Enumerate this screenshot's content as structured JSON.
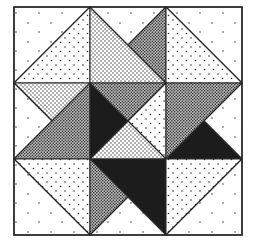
{
  "figure": {
    "grid": {
      "rows": 3,
      "cols": 3,
      "x": [
        14,
        90,
        166,
        242
      ],
      "y": [
        7,
        83,
        159,
        235
      ]
    },
    "colors": {
      "background": "#ffffff",
      "line": "#2a2a2a",
      "ink": "#1c1c1c"
    },
    "fabrics": {
      "sparse": "white with scattered dots",
      "light": "light dotted",
      "medium": "medium dotted",
      "dense": "dense dotted",
      "black": "solid black"
    },
    "blocks": [
      {
        "name": "block-top-left",
        "triangles": [
          {
            "points": "14,7 90,7 14,83",
            "fabric": "sparse"
          },
          {
            "points": "90,7 90,83 14,83",
            "fabric": "light"
          }
        ]
      },
      {
        "name": "block-top-center",
        "triangles": [
          {
            "points": "90,7 90,83 166,83",
            "fabric": "medium"
          },
          {
            "points": "90,7 166,7 128,45",
            "fabric": "sparse"
          },
          {
            "points": "166,7 166,83 128,45",
            "fabric": "dense"
          }
        ]
      },
      {
        "name": "block-top-right",
        "triangles": [
          {
            "points": "166,7 242,7 242,83",
            "fabric": "sparse"
          },
          {
            "points": "166,7 166,83 242,83",
            "fabric": "light"
          }
        ]
      },
      {
        "name": "block-middle-left",
        "triangles": [
          {
            "points": "14,83 90,83 52,121",
            "fabric": "medium"
          },
          {
            "points": "14,83 14,159 52,121",
            "fabric": "sparse"
          },
          {
            "points": "90,83 90,159 14,159",
            "fabric": "dense"
          }
        ]
      },
      {
        "name": "block-center",
        "triangles": [
          {
            "points": "90,83 90,159 128,121",
            "fabric": "black"
          },
          {
            "points": "90,83 166,83 128,121",
            "fabric": "dense"
          },
          {
            "points": "166,83 166,159 128,121",
            "fabric": "light"
          },
          {
            "points": "90,159 166,159 128,121",
            "fabric": "medium"
          }
        ]
      },
      {
        "name": "block-middle-right",
        "triangles": [
          {
            "points": "166,83 242,83 166,159",
            "fabric": "dense"
          },
          {
            "points": "242,83 242,159 204,121",
            "fabric": "sparse"
          },
          {
            "points": "166,159 242,159 204,121",
            "fabric": "black"
          }
        ]
      },
      {
        "name": "block-bottom-left",
        "triangles": [
          {
            "points": "14,159 90,159 90,235",
            "fabric": "light"
          },
          {
            "points": "14,159 14,235 90,235",
            "fabric": "sparse"
          }
        ]
      },
      {
        "name": "block-bottom-center",
        "triangles": [
          {
            "points": "90,159 166,159 166,235",
            "fabric": "black"
          },
          {
            "points": "90,159 90,235 128,197",
            "fabric": "dense"
          },
          {
            "points": "90,235 166,235 128,197",
            "fabric": "sparse"
          }
        ]
      },
      {
        "name": "block-bottom-right",
        "triangles": [
          {
            "points": "166,159 242,159 166,235",
            "fabric": "light"
          },
          {
            "points": "242,159 242,235 166,235",
            "fabric": "sparse"
          }
        ]
      }
    ]
  }
}
